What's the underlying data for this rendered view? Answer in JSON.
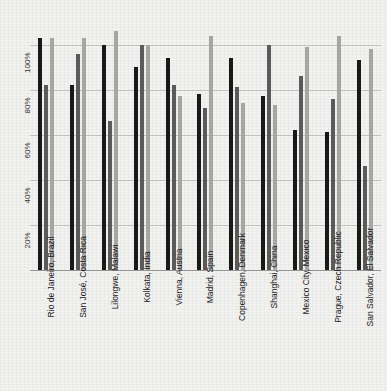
{
  "title": {
    "text": "",
    "visible": false,
    "note": "cut-off at top edge, illegible"
  },
  "chart_data": {
    "type": "bar",
    "title": "",
    "xlabel": "",
    "ylabel": "",
    "ylim": [
      0,
      110
    ],
    "grid": true,
    "legend": "none",
    "ytick_labels": [
      "100%",
      "80%",
      "60%",
      "40%",
      "20%"
    ],
    "ytick_values": [
      100,
      80,
      60,
      40,
      20
    ],
    "categories": [
      "Rio de Janeiro, Brazil",
      "San José, Costa Rica",
      "Lilongwe, Malawi",
      "Kolkata, India",
      "Vienna, Austria",
      "Madrid, Spain",
      "Copenhagen, Denmark",
      "Shanghai, China",
      "Mexico City, Mexico",
      "Prague, Czech Republic",
      "San Salvador, El Salvador"
    ],
    "series": [
      {
        "name": "series-1",
        "color": "#191919",
        "values": [
          103,
          82,
          100,
          90,
          94,
          78,
          94,
          77,
          62,
          61,
          93
        ]
      },
      {
        "name": "series-2",
        "color": "#5c5c5c",
        "values": [
          82,
          96,
          66,
          100,
          82,
          72,
          81,
          100,
          86,
          76,
          46
        ]
      },
      {
        "name": "series-3",
        "color": "#a8a8a6",
        "values": [
          103,
          103,
          106,
          100,
          77,
          104,
          74,
          73,
          99,
          104,
          98
        ]
      }
    ]
  }
}
